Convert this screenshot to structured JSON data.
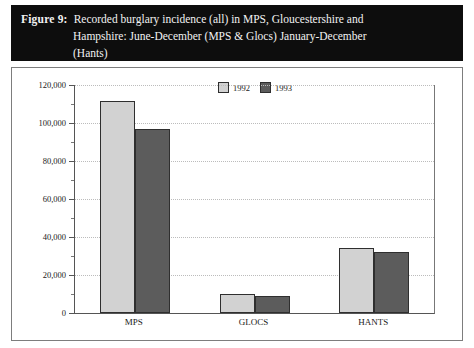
{
  "figure": {
    "label": "Figure 9:",
    "caption_line1": "Recorded burglary incidence (all) in MPS, Gloucestershire and",
    "caption_line2": "Hampshire: June-December (MPS & Glocs) January-December",
    "caption_line3": "(Hants)",
    "banner_color": "#0d0d0d"
  },
  "chart_data": {
    "type": "bar",
    "title": "Recorded burglary incidence (all) in MPS, Gloucestershire and Hampshire: June-December (MPS & Glocs) January-December (Hants)",
    "xlabel": "",
    "ylabel": "Number of Offences",
    "categories": [
      "MPS",
      "GLOCS",
      "HANTS"
    ],
    "series": [
      {
        "name": "1992",
        "color": "#d2d2d2",
        "values": [
          111500,
          10000,
          34000
        ]
      },
      {
        "name": "1993",
        "color": "#5c5c5c",
        "values": [
          97000,
          8800,
          32200
        ]
      }
    ],
    "ylim": [
      0,
      120000
    ],
    "ytick_values": [
      0,
      20000,
      40000,
      60000,
      80000,
      100000,
      120000
    ],
    "ytick_labels": [
      "0",
      "20,000",
      "40,000",
      "60,000",
      "80,000",
      "100,000",
      "120,000"
    ],
    "minor_tick_count_between": 1,
    "grid": true,
    "grid_style": "dotted",
    "legend_position": "top-center",
    "legend_entries": [
      "1992",
      "1993"
    ]
  }
}
